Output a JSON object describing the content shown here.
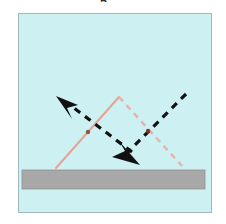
{
  "figure": {
    "type": "optics-reflection-diagram",
    "caption_clipped_text": "g",
    "panel": {
      "x": 18,
      "y": 13,
      "width": 194,
      "height": 200,
      "fill_color": "#cdf0f2",
      "border_color": "#9fb7bd",
      "border_width": 1
    },
    "surface_bar": {
      "label": "reflecting-surface",
      "x": 22,
      "y": 170,
      "width": 183,
      "height": 19,
      "fill_color": "#a8a8a8",
      "border_color": "#8f8f8f"
    },
    "rays": [
      {
        "name": "incident-solid-ray",
        "style": "solid",
        "color": "#e8a394",
        "width": 2,
        "points": [
          [
            56,
            168
          ],
          [
            119,
            97
          ]
        ]
      },
      {
        "name": "reflected-dashed-ray",
        "style": "dashed",
        "color": "#e8b3a6",
        "width": 2.4,
        "dash": "6 5",
        "points": [
          [
            119,
            97
          ],
          [
            182,
            166
          ]
        ]
      },
      {
        "name": "black-ray-up-left",
        "style": "dashed",
        "color": "#111111",
        "width": 3.2,
        "dash": "7 6",
        "points": [
          [
            132,
            152
          ],
          [
            70,
            105
          ]
        ]
      },
      {
        "name": "black-ray-down-right",
        "style": "dashed",
        "color": "#111111",
        "width": 3.2,
        "dash": "7 6",
        "points": [
          [
            186,
            94
          ],
          [
            126,
            154
          ]
        ]
      }
    ],
    "arrowheads": [
      {
        "name": "arrowhead-up-left",
        "color": "#111111",
        "tip": [
          56,
          96
        ],
        "points": "56,96 77,104 67,108 71,118"
      },
      {
        "name": "arrowhead-down-right",
        "color": "#111111",
        "tip": [
          139,
          164
        ],
        "points": "139,164 113,156 125,151 119,142"
      }
    ],
    "intersections": [
      {
        "name": "intersection-left",
        "x": 88,
        "y": 132,
        "r": 2.2,
        "color": "#8a5548"
      },
      {
        "name": "intersection-right",
        "x": 148,
        "y": 131,
        "r": 2.2,
        "color": "#7a3a33"
      }
    ],
    "colors": {
      "panel_fill": "#cdf0f2",
      "panel_border": "#9fb7bd",
      "surface": "#a8a8a8",
      "solid_ray": "#e8a394",
      "dashed_ray": "#e8b3a6",
      "black_ray": "#111111",
      "background": "#ffffff"
    }
  }
}
